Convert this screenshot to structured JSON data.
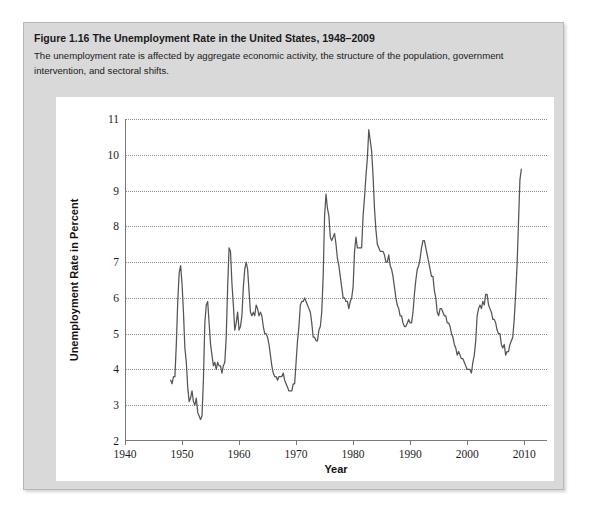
{
  "figure": {
    "number_label": "Figure 1.16",
    "title": "The Unemployment Rate in the United States, 1948–2009",
    "caption": "The unemployment rate is affected by aggregate economic activity, the structure of the population, government intervention, and sectoral shifts."
  },
  "colors": {
    "page_background": "#ffffff",
    "card_background": "#d9d9d9",
    "panel_background": "#ffffff",
    "axis": "#7a7a7a",
    "gridline": "#8c8c8c",
    "series_line": "#555555",
    "text": "#1a1a1a"
  },
  "chart_data": {
    "type": "line",
    "title": "The Unemployment Rate in the United States, 1948–2009",
    "xlabel": "Year",
    "ylabel": "Unemployment Rate in Percent",
    "xlim": [
      1940,
      2014
    ],
    "ylim": [
      2,
      11
    ],
    "xticks": [
      1940,
      1950,
      1960,
      1970,
      1980,
      1990,
      2000,
      2010
    ],
    "yticks": [
      2,
      3,
      4,
      5,
      6,
      7,
      8,
      9,
      10,
      11
    ],
    "grid": "horizontal-dotted",
    "legend": "none",
    "series": [
      {
        "name": "Unemployment Rate",
        "x": [
          1948.0,
          1948.25,
          1948.5,
          1948.75,
          1949.0,
          1949.25,
          1949.5,
          1949.75,
          1950.0,
          1950.25,
          1950.5,
          1950.75,
          1951.0,
          1951.25,
          1951.5,
          1951.75,
          1952.0,
          1952.25,
          1952.5,
          1952.75,
          1953.0,
          1953.25,
          1953.5,
          1953.75,
          1954.0,
          1954.25,
          1954.5,
          1954.75,
          1955.0,
          1955.25,
          1955.5,
          1955.75,
          1956.0,
          1956.25,
          1956.5,
          1956.75,
          1957.0,
          1957.25,
          1957.5,
          1957.75,
          1958.0,
          1958.25,
          1958.5,
          1958.75,
          1959.0,
          1959.25,
          1959.5,
          1959.75,
          1960.0,
          1960.25,
          1960.5,
          1960.75,
          1961.0,
          1961.25,
          1961.5,
          1961.75,
          1962.0,
          1962.25,
          1962.5,
          1962.75,
          1963.0,
          1963.25,
          1963.5,
          1963.75,
          1964.0,
          1964.25,
          1964.5,
          1964.75,
          1965.0,
          1965.25,
          1965.5,
          1965.75,
          1966.0,
          1966.25,
          1966.5,
          1966.75,
          1967.0,
          1967.25,
          1967.5,
          1967.75,
          1968.0,
          1968.25,
          1968.5,
          1968.75,
          1969.0,
          1969.25,
          1969.5,
          1969.75,
          1970.0,
          1970.25,
          1970.5,
          1970.75,
          1971.0,
          1971.25,
          1971.5,
          1971.75,
          1972.0,
          1972.25,
          1972.5,
          1972.75,
          1973.0,
          1973.25,
          1973.5,
          1973.75,
          1974.0,
          1974.25,
          1974.5,
          1974.75,
          1975.0,
          1975.25,
          1975.5,
          1975.75,
          1976.0,
          1976.25,
          1976.5,
          1976.75,
          1977.0,
          1977.25,
          1977.5,
          1977.75,
          1978.0,
          1978.25,
          1978.5,
          1978.75,
          1979.0,
          1979.25,
          1979.5,
          1979.75,
          1980.0,
          1980.25,
          1980.5,
          1980.75,
          1981.0,
          1981.25,
          1981.5,
          1981.75,
          1982.0,
          1982.25,
          1982.5,
          1982.75,
          1983.0,
          1983.25,
          1983.5,
          1983.75,
          1984.0,
          1984.25,
          1984.5,
          1984.75,
          1985.0,
          1985.25,
          1985.5,
          1985.75,
          1986.0,
          1986.25,
          1986.5,
          1986.75,
          1987.0,
          1987.25,
          1987.5,
          1987.75,
          1988.0,
          1988.25,
          1988.5,
          1988.75,
          1989.0,
          1989.25,
          1989.5,
          1989.75,
          1990.0,
          1990.25,
          1990.5,
          1990.75,
          1991.0,
          1991.25,
          1991.5,
          1991.75,
          1992.0,
          1992.25,
          1992.5,
          1992.75,
          1993.0,
          1993.25,
          1993.5,
          1993.75,
          1994.0,
          1994.25,
          1994.5,
          1994.75,
          1995.0,
          1995.25,
          1995.5,
          1995.75,
          1996.0,
          1996.25,
          1996.5,
          1996.75,
          1997.0,
          1997.25,
          1997.5,
          1997.75,
          1998.0,
          1998.25,
          1998.5,
          1998.75,
          1999.0,
          1999.25,
          1999.5,
          1999.75,
          2000.0,
          2000.25,
          2000.5,
          2000.75,
          2001.0,
          2001.25,
          2001.5,
          2001.75,
          2002.0,
          2002.25,
          2002.5,
          2002.75,
          2003.0,
          2003.25,
          2003.5,
          2003.75,
          2004.0,
          2004.25,
          2004.5,
          2004.75,
          2005.0,
          2005.25,
          2005.5,
          2005.75,
          2006.0,
          2006.25,
          2006.5,
          2006.75,
          2007.0,
          2007.25,
          2007.5,
          2007.75,
          2008.0,
          2008.25,
          2008.5,
          2008.75,
          2009.0,
          2009.25,
          2009.5
        ],
        "values": [
          3.7,
          3.6,
          3.8,
          3.8,
          4.7,
          5.9,
          6.7,
          6.9,
          6.4,
          5.6,
          4.6,
          4.2,
          3.5,
          3.1,
          3.2,
          3.4,
          3.1,
          3.0,
          3.2,
          2.8,
          2.7,
          2.6,
          2.7,
          3.7,
          5.3,
          5.8,
          5.9,
          5.3,
          4.7,
          4.4,
          4.1,
          4.2,
          4.0,
          4.2,
          4.1,
          4.1,
          3.9,
          4.1,
          4.2,
          4.9,
          6.3,
          7.4,
          7.3,
          6.4,
          5.8,
          5.1,
          5.3,
          5.6,
          5.1,
          5.2,
          5.5,
          6.3,
          6.8,
          7.0,
          6.8,
          6.2,
          5.6,
          5.5,
          5.6,
          5.5,
          5.8,
          5.7,
          5.5,
          5.6,
          5.5,
          5.2,
          5.0,
          5.0,
          4.9,
          4.7,
          4.4,
          4.1,
          3.9,
          3.8,
          3.8,
          3.7,
          3.8,
          3.8,
          3.8,
          3.9,
          3.7,
          3.6,
          3.5,
          3.4,
          3.4,
          3.4,
          3.6,
          3.6,
          4.2,
          4.8,
          5.2,
          5.8,
          5.9,
          5.9,
          6.0,
          5.9,
          5.8,
          5.7,
          5.6,
          5.3,
          4.9,
          4.9,
          4.8,
          4.8,
          5.1,
          5.2,
          5.6,
          6.6,
          8.3,
          8.9,
          8.5,
          8.3,
          7.7,
          7.6,
          7.7,
          7.8,
          7.5,
          7.1,
          6.9,
          6.6,
          6.3,
          6.0,
          6.0,
          5.9,
          5.9,
          5.7,
          5.9,
          6.0,
          6.3,
          7.3,
          7.7,
          7.4,
          7.4,
          7.4,
          7.4,
          8.3,
          8.8,
          9.4,
          9.9,
          10.7,
          10.4,
          10.1,
          9.4,
          8.5,
          7.9,
          7.5,
          7.4,
          7.3,
          7.3,
          7.3,
          7.2,
          7.0,
          7.0,
          7.2,
          6.9,
          6.8,
          6.6,
          6.3,
          6.0,
          5.8,
          5.7,
          5.5,
          5.5,
          5.3,
          5.2,
          5.2,
          5.3,
          5.4,
          5.3,
          5.3,
          5.6,
          6.1,
          6.5,
          6.8,
          6.9,
          7.1,
          7.4,
          7.6,
          7.6,
          7.4,
          7.2,
          7.0,
          6.8,
          6.6,
          6.6,
          6.2,
          6.0,
          5.6,
          5.5,
          5.7,
          5.7,
          5.6,
          5.5,
          5.5,
          5.3,
          5.3,
          5.2,
          5.0,
          4.9,
          4.7,
          4.6,
          4.4,
          4.5,
          4.4,
          4.3,
          4.3,
          4.2,
          4.1,
          4.0,
          4.0,
          4.0,
          3.9,
          4.2,
          4.4,
          4.8,
          5.5,
          5.7,
          5.8,
          5.7,
          5.9,
          5.8,
          6.1,
          6.1,
          5.8,
          5.7,
          5.6,
          5.4,
          5.4,
          5.3,
          5.1,
          5.0,
          5.0,
          4.7,
          4.6,
          4.7,
          4.4,
          4.5,
          4.5,
          4.7,
          4.8,
          4.9,
          5.4,
          6.1,
          6.9,
          8.1,
          9.3,
          9.6
        ]
      }
    ],
    "annotations": []
  },
  "axis_labels": {
    "y": [
      "11",
      "10",
      "9",
      "8",
      "7",
      "6",
      "5",
      "4",
      "3",
      "2"
    ],
    "x": [
      "1940",
      "1950",
      "1960",
      "1970",
      "1980",
      "1990",
      "2000",
      "2010"
    ]
  }
}
